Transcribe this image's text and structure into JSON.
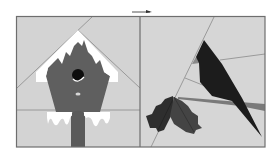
{
  "figure": {
    "panels": [
      {
        "id": "left",
        "subject": "birdhouse with snow"
      },
      {
        "id": "right",
        "subject": "cardinal bird on branch with holly leaves"
      }
    ],
    "colors": {
      "background": "#ffffff",
      "fabric_light": "#d6d6d6",
      "fabric_mid": "#cbcbcb",
      "frame": "#6e6e6e",
      "seam": "#8a8a8a",
      "birdhouse": "#5f5f5f",
      "snow": "#ffffff",
      "hole": "#0d0d0d",
      "bird": "#1c1c1c",
      "holly": "#2e2e2e",
      "holly_shade": "#444444",
      "branch": "#7a7a7a"
    },
    "arrow_indicator": "right-arrow"
  }
}
